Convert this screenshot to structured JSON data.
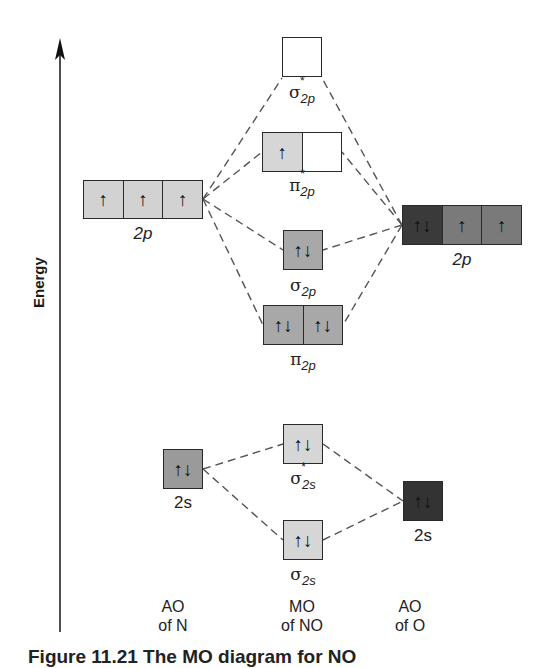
{
  "axis": {
    "label": "Energy",
    "direction": "up"
  },
  "columns": [
    {
      "id": "ao_n",
      "line1": "AO",
      "line2": "of N"
    },
    {
      "id": "mo_no",
      "line1": "MO",
      "line2": "of NO"
    },
    {
      "id": "ao_o",
      "line1": "AO",
      "line2": "of O"
    }
  ],
  "colors": {
    "n_ao_2p": "#d2d2d2",
    "n_ao_2s": "#9a9a9a",
    "o_ao_2p_paired": "#3a3a3a",
    "o_ao_2p_single": "#7a7a7a",
    "o_ao_2s": "#333333",
    "mo_light": "#d6d6d6",
    "mo_mid": "#a8a8a8",
    "mo_empty": "#ffffff",
    "dash_line": "#555555"
  },
  "orbitals": {
    "n_2p": {
      "label": "2p",
      "cells": [
        "↑",
        "↑",
        "↑"
      ]
    },
    "n_2s": {
      "label": "2s",
      "cells": [
        "↑↓"
      ]
    },
    "o_2p": {
      "label": "2p",
      "cells": [
        "↑↓",
        "↑",
        "↑"
      ]
    },
    "o_2s": {
      "label": "2s",
      "cells": [
        "↑↓"
      ]
    },
    "sigma_star_2p": {
      "symbol": "σ",
      "star": "*",
      "sub": "2p",
      "cells": [
        ""
      ]
    },
    "pi_star_2p": {
      "symbol": "π",
      "star": "*",
      "sub": "2p",
      "cells": [
        "↑",
        ""
      ]
    },
    "sigma_2p": {
      "symbol": "σ",
      "star": "",
      "sub": "2p",
      "cells": [
        "↑↓"
      ]
    },
    "pi_2p": {
      "symbol": "π",
      "star": "",
      "sub": "2p",
      "cells": [
        "↑↓",
        "↑↓"
      ]
    },
    "sigma_star_2s": {
      "symbol": "σ",
      "star": "*",
      "sub": "2s",
      "cells": [
        "↑↓"
      ]
    },
    "sigma_2s": {
      "symbol": "σ",
      "star": "",
      "sub": "2s",
      "cells": [
        "↑↓"
      ]
    }
  },
  "caption": "Figure 11.21  The MO diagram for NO"
}
